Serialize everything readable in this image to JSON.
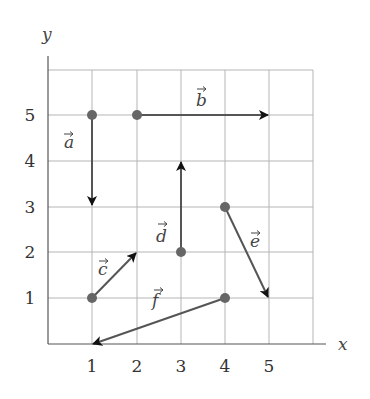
{
  "diagram": {
    "type": "vector-grid",
    "x_axis": {
      "label": "x",
      "ticks": [
        "1",
        "2",
        "3",
        "4",
        "5"
      ]
    },
    "y_axis": {
      "label": "y",
      "ticks": [
        "1",
        "2",
        "3",
        "4",
        "5"
      ]
    },
    "grid": {
      "xmin": 0,
      "xmax": 6,
      "ymin": 0,
      "ymax": 6
    },
    "vectors": [
      {
        "name": "a",
        "label": "a",
        "from": [
          1,
          5
        ],
        "to": [
          1,
          3
        ]
      },
      {
        "name": "b",
        "label": "b",
        "from": [
          2,
          5
        ],
        "to": [
          5,
          5
        ]
      },
      {
        "name": "c",
        "label": "c",
        "from": [
          1,
          1
        ],
        "to": [
          2,
          2
        ]
      },
      {
        "name": "d",
        "label": "d",
        "from": [
          3,
          2
        ],
        "to": [
          3,
          4
        ]
      },
      {
        "name": "e",
        "label": "e",
        "from": [
          4,
          3
        ],
        "to": [
          5,
          1
        ]
      },
      {
        "name": "f",
        "label": "f",
        "from": [
          4,
          1
        ],
        "to": [
          1,
          0
        ]
      }
    ],
    "colors": {
      "grid": "#b0b0b0",
      "axis": "#555555",
      "vector": "#555555",
      "arrowhead": "#111111",
      "dot": "#666666"
    }
  }
}
